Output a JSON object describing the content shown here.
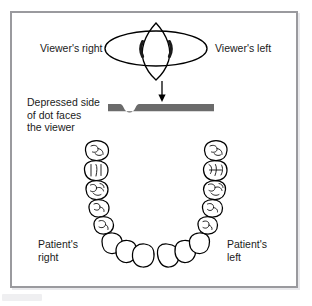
{
  "figure": {
    "kind": "dental-orientation-diagram",
    "frame": {
      "border_color": "#9a9a9e",
      "background": "#ffffff"
    }
  },
  "labels": {
    "viewer_right": "Viewer's right",
    "viewer_left": "Viewer's left",
    "depressed_side": "Depressed side\nof dot faces\nthe viewer",
    "depressed_side_lines": [
      "Depressed side",
      "of dot faces",
      "the viewer"
    ],
    "patient_right": "Patient's\nright",
    "patient_right_lines": [
      "Patient's",
      "right"
    ],
    "patient_left": "Patient's\nleft",
    "patient_left_lines": [
      "Patient's",
      "left"
    ]
  },
  "artwork": {
    "eye": {
      "name": "eye-lens-diagram",
      "outline_color": "#000000",
      "mark_color": "#1a1a1a",
      "shape": "horizontal ellipse overlapped by a vertical pointed lens (vesica) with two dark crescent marks at the intersections"
    },
    "arrow": {
      "name": "down-arrow",
      "color": "#000000",
      "direction": "down"
    },
    "film_bar": {
      "name": "film-edge-bar",
      "color": "#6b6b6b",
      "notch": "rounded depression on the upper edge near the left end",
      "notch_label": "depressed dot"
    },
    "arch": {
      "name": "mandibular-dental-arch",
      "outline_color": "#000000",
      "fill": "#ffffff",
      "view": "occlusal view of lower arch",
      "posterior_teeth_per_side": 5,
      "anterior_teeth": 6,
      "total_teeth": 16
    }
  },
  "colors": {
    "ink": "#000000",
    "text": "#1b1b1b",
    "bar_gray": "#6b6b6b",
    "frame_gray": "#9a9a9e",
    "paper": "#ffffff"
  }
}
